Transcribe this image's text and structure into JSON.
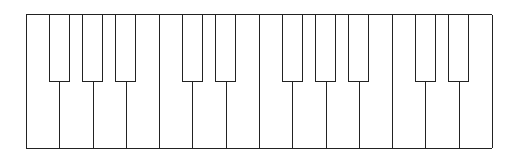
{
  "keyboard": {
    "white_keys": [
      "F",
      "G",
      "A",
      "B",
      "C",
      "D",
      "E",
      "F",
      "G",
      "A",
      "B",
      "C",
      "D",
      "E"
    ],
    "black_keys": [
      {
        "note": "F#",
        "after_white": 0
      },
      {
        "note": "G#",
        "after_white": 1
      },
      {
        "note": "A#",
        "after_white": 2
      },
      {
        "note": "C#",
        "after_white": 4
      },
      {
        "note": "D#",
        "after_white": 5
      },
      {
        "note": "F#",
        "after_white": 7
      },
      {
        "note": "G#",
        "after_white": 8
      },
      {
        "note": "A#",
        "after_white": 9
      },
      {
        "note": "C#",
        "after_white": 11
      },
      {
        "note": "D#",
        "after_white": 12
      }
    ],
    "colors": {
      "outline": "#222222",
      "key_fill": "#ffffff"
    }
  }
}
